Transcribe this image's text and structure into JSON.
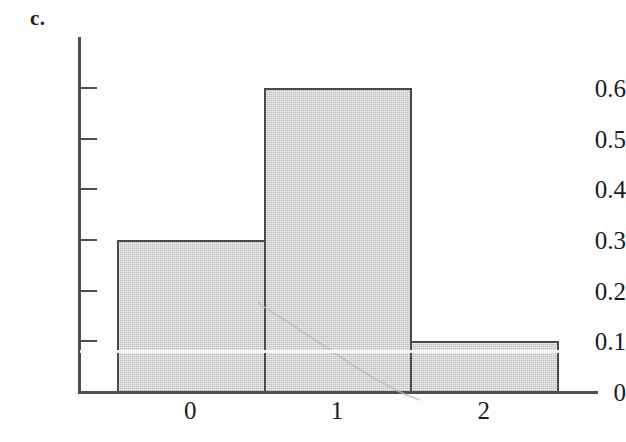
{
  "figure": {
    "panel_label": "c.",
    "background_color": "#fdfdfd",
    "axis_color": "#4e4e4e",
    "bar_fill_color": "#d2d2d2",
    "bar_border_color": "#4a4a4a",
    "text_color": "#1c1c1c"
  },
  "chart_data": {
    "type": "bar",
    "title": "c.",
    "xlabel": "",
    "ylabel": "",
    "categories": [
      "0",
      "1",
      "2"
    ],
    "values": [
      0.3,
      0.6,
      0.1
    ],
    "x": [
      0,
      1,
      2
    ],
    "xlim": [
      -0.5,
      2.5
    ],
    "ylim": [
      0,
      0.68
    ],
    "y_ticks": [
      0,
      0.1,
      0.2,
      0.3,
      0.4,
      0.5,
      0.6
    ],
    "y_tick_labels": [
      "0",
      "0.1",
      "0.2",
      "0.3",
      "0.4",
      "0.5",
      "0.6"
    ],
    "x_ticks": [
      0,
      1,
      2
    ],
    "x_tick_labels": [
      "0",
      "1",
      "2"
    ],
    "grid": false,
    "legend": null,
    "legend_position": "none",
    "bar_width": 1.0
  },
  "y_axis": {
    "ticks": [
      {
        "label": "0.6",
        "value": 0.6
      },
      {
        "label": "0.5",
        "value": 0.5
      },
      {
        "label": "0.4",
        "value": 0.4
      },
      {
        "label": "0.3",
        "value": 0.3
      },
      {
        "label": "0.2",
        "value": 0.2
      },
      {
        "label": "0.1",
        "value": 0.1
      },
      {
        "label": "0",
        "value": 0
      }
    ]
  },
  "x_axis": {
    "ticks": [
      {
        "label": "0",
        "value": 0
      },
      {
        "label": "1",
        "value": 1
      },
      {
        "label": "2",
        "value": 2
      }
    ]
  },
  "bars": [
    {
      "category": "0",
      "value": 0.3
    },
    {
      "category": "1",
      "value": 0.6
    },
    {
      "category": "2",
      "value": 0.1
    }
  ]
}
